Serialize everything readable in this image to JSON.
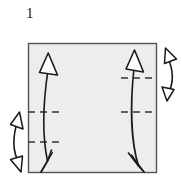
{
  "figure": {
    "step_number": "1",
    "type": "origami-fold-diagram",
    "canvas": {
      "width": 182,
      "height": 182
    },
    "colors": {
      "background": "#ffffff",
      "paper_fill": "#ededed",
      "stroke": "#1a1a1a",
      "paper_border": "#555555",
      "crease_dash": "#333333"
    },
    "paper": {
      "name": "square-sheet",
      "x": 28,
      "y": 43,
      "width": 128,
      "height": 129
    },
    "crease_lines": [
      {
        "name": "crease-left-upper",
        "x1": 28,
        "y1": 112,
        "x2": 63,
        "y2": 112
      },
      {
        "name": "crease-left-lower",
        "x1": 28,
        "y1": 142,
        "x2": 63,
        "y2": 142
      },
      {
        "name": "crease-right-upper",
        "x1": 121,
        "y1": 78,
        "x2": 157,
        "y2": 78
      },
      {
        "name": "crease-right-lower",
        "x1": 121,
        "y1": 112,
        "x2": 157,
        "y2": 112
      }
    ],
    "fold_arrows": [
      {
        "name": "fold-arrow-inner-left",
        "direction": "up",
        "from_y": 160,
        "to_y": 55
      },
      {
        "name": "fold-arrow-inner-right",
        "direction": "up",
        "from_y": 165,
        "to_y": 50
      }
    ],
    "measure_arrows": [
      {
        "name": "measure-arrow-outer-left",
        "orientation": "vertical",
        "top_y": 112,
        "bottom_y": 172
      },
      {
        "name": "measure-arrow-outer-right",
        "orientation": "vertical",
        "top_y": 48,
        "bottom_y": 100
      }
    ]
  }
}
